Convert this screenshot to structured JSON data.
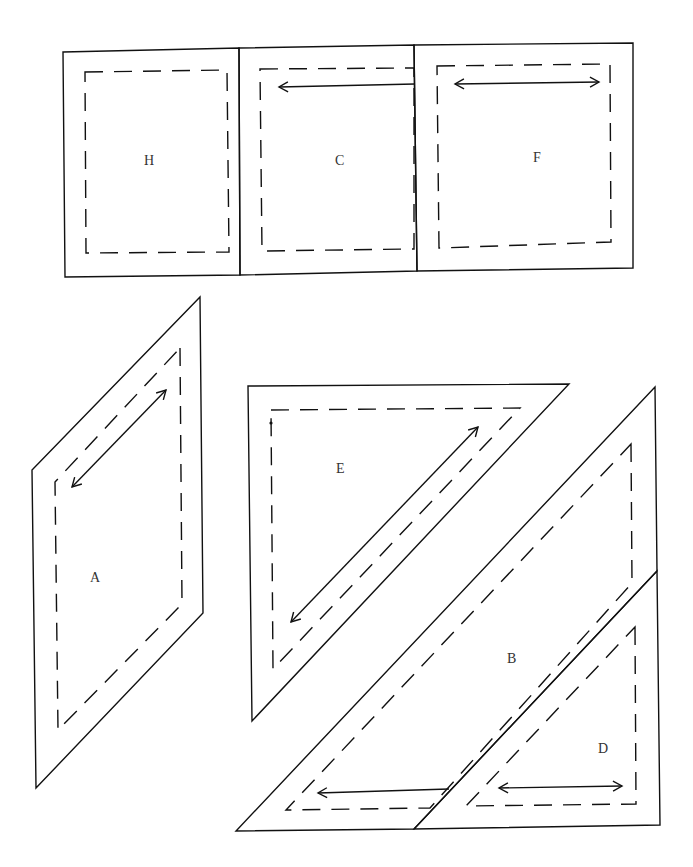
{
  "diagram": {
    "type": "quilt-template-pieces",
    "pieces": [
      {
        "id": "H",
        "label": "H",
        "shape": "rectangle",
        "grainline": "none"
      },
      {
        "id": "C",
        "label": "C",
        "shape": "rectangle",
        "grainline": "single-arrow-left"
      },
      {
        "id": "F",
        "label": "F",
        "shape": "rectangle",
        "grainline": "double-arrow-horizontal"
      },
      {
        "id": "A",
        "label": "A",
        "shape": "parallelogram",
        "grainline": "double-arrow-diagonal"
      },
      {
        "id": "E",
        "label": "E",
        "shape": "triangle",
        "grainline": "double-arrow-diagonal"
      },
      {
        "id": "B",
        "label": "B",
        "shape": "parallelogram",
        "grainline": "single-arrow-left"
      },
      {
        "id": "D",
        "label": "D",
        "shape": "triangle",
        "grainline": "double-arrow-horizontal"
      }
    ],
    "legend": {
      "solid_line": "cutting line",
      "dashed_line": "seam line",
      "arrow": "grainline"
    }
  }
}
